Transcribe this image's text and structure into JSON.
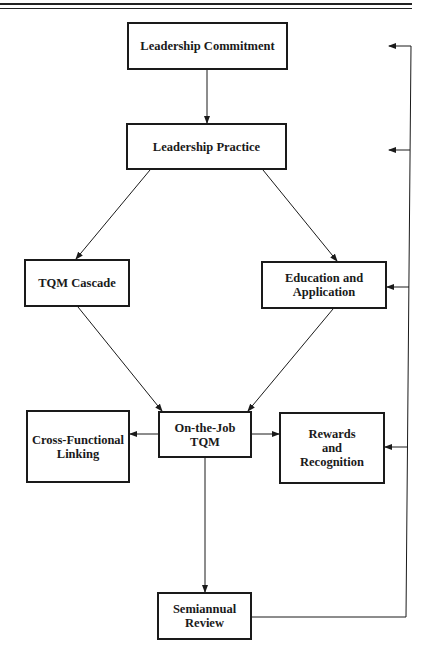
{
  "diagram": {
    "type": "flowchart",
    "nodes": {
      "leadership_commitment": {
        "lines": [
          "Leadership Commitment"
        ]
      },
      "leadership_practice": {
        "lines": [
          "Leadership Practice"
        ]
      },
      "tqm_cascade": {
        "lines": [
          "TQM Cascade"
        ]
      },
      "education_application": {
        "lines": [
          "Education and",
          "Application"
        ]
      },
      "cross_functional": {
        "lines": [
          "Cross-Functional",
          "Linking"
        ]
      },
      "on_the_job": {
        "lines": [
          "On-the-Job",
          "TQM"
        ]
      },
      "rewards": {
        "lines": [
          "Rewards",
          "and",
          "Recognition"
        ]
      },
      "semiannual": {
        "lines": [
          "Semiannual",
          "Review"
        ]
      }
    },
    "edges": [
      {
        "from": "Leadership Commitment",
        "to": "Leadership Practice"
      },
      {
        "from": "Leadership Practice",
        "to": "TQM Cascade"
      },
      {
        "from": "Leadership Practice",
        "to": "Education and Application"
      },
      {
        "from": "TQM Cascade",
        "to": "On-the-Job TQM"
      },
      {
        "from": "Education and Application",
        "to": "On-the-Job TQM"
      },
      {
        "from": "On-the-Job TQM",
        "to": "Cross-Functional Linking"
      },
      {
        "from": "On-the-Job TQM",
        "to": "Rewards and Recognition"
      },
      {
        "from": "On-the-Job TQM",
        "to": "Semiannual Review"
      },
      {
        "from": "Semiannual Review",
        "to": "Leadership Commitment",
        "kind": "feedback"
      },
      {
        "from": "Semiannual Review",
        "to": "Leadership Practice",
        "kind": "feedback"
      },
      {
        "from": "Semiannual Review",
        "to": "Education and Application",
        "kind": "feedback"
      },
      {
        "from": "Semiannual Review",
        "to": "Rewards and Recognition",
        "kind": "feedback"
      }
    ]
  }
}
